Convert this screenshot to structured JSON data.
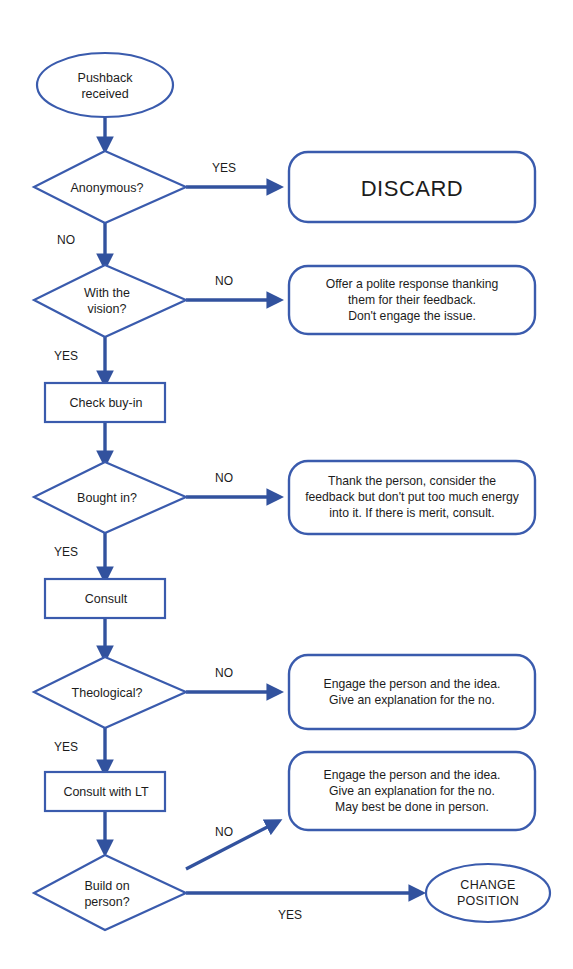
{
  "diagram": {
    "colors": {
      "stroke": "#3a5bad",
      "connector": "#32529e",
      "text": "#1c1c1c",
      "background": "#ffffff"
    }
  },
  "nodes": {
    "start": {
      "type": "terminator",
      "line1": "Pushback",
      "line2": "received"
    },
    "d_anonymous": {
      "type": "decision",
      "line1": "Anonymous?",
      "line2": ""
    },
    "d_vision": {
      "type": "decision",
      "line1": "With the",
      "line2": "vision?"
    },
    "p_check_buyin": {
      "type": "process",
      "label": "Check buy-in"
    },
    "d_bought_in": {
      "type": "decision",
      "line1": "Bought in?",
      "line2": ""
    },
    "p_consult": {
      "type": "process",
      "label": "Consult"
    },
    "d_theological": {
      "type": "decision",
      "line1": "Theological?",
      "line2": ""
    },
    "p_consult_lt": {
      "type": "process",
      "label": "Consult with LT"
    },
    "d_build_on_person": {
      "type": "decision",
      "line1": "Build on",
      "line2": "person?"
    },
    "end_change_position": {
      "type": "terminator",
      "line1": "CHANGE",
      "line2": "POSITION"
    }
  },
  "outcomes": {
    "discard": {
      "type": "rounded",
      "lines": [
        "DISCARD"
      ]
    },
    "polite_response": {
      "type": "rounded",
      "lines": [
        "Offer a polite response thanking",
        "them for their feedback.",
        "Don't engage the issue."
      ]
    },
    "thank_person": {
      "type": "rounded",
      "lines": [
        "Thank the person, consider the",
        "feedback but don't put too much energy",
        "into it. If there is merit, consult."
      ]
    },
    "engage_idea": {
      "type": "rounded",
      "lines": [
        "Engage the person and the idea.",
        "Give an explanation for the no."
      ]
    },
    "engage_idea_in_person": {
      "type": "rounded",
      "lines": [
        "Engage the person and the idea.",
        "Give an explanation for the no.",
        "May best be done in person."
      ]
    }
  },
  "edges": [
    {
      "id": "start-to-anonymous",
      "label": ""
    },
    {
      "id": "anonymous-yes-discard",
      "label": "YES"
    },
    {
      "id": "anonymous-no-vision",
      "label": "NO"
    },
    {
      "id": "vision-no-polite",
      "label": "NO"
    },
    {
      "id": "vision-yes-checkbuyin",
      "label": "YES"
    },
    {
      "id": "checkbuyin-to-boughtin",
      "label": ""
    },
    {
      "id": "boughtin-no-thank",
      "label": "NO"
    },
    {
      "id": "boughtin-yes-consult",
      "label": "YES"
    },
    {
      "id": "consult-to-theological",
      "label": ""
    },
    {
      "id": "theological-no-engage",
      "label": "NO"
    },
    {
      "id": "theological-yes-consultlt",
      "label": "YES"
    },
    {
      "id": "consultlt-to-buildon",
      "label": ""
    },
    {
      "id": "buildon-no-engage-person",
      "label": "NO"
    },
    {
      "id": "buildon-yes-change",
      "label": "YES"
    }
  ],
  "edge_labels": {
    "anonymous_yes": "YES",
    "anonymous_no": "NO",
    "vision_no": "NO",
    "vision_yes": "YES",
    "boughtin_no": "NO",
    "boughtin_yes": "YES",
    "theological_no": "NO",
    "theological_yes": "YES",
    "buildon_no": "NO",
    "buildon_yes": "YES"
  }
}
